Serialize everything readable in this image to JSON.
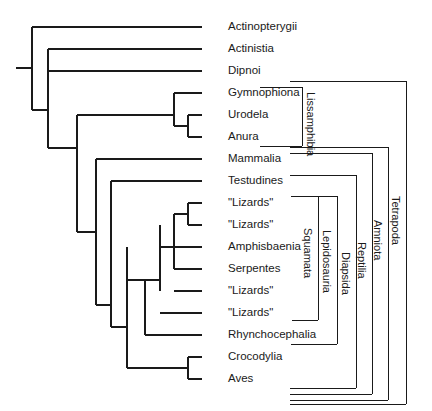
{
  "figure": {
    "type": "cladogram",
    "width": 432,
    "height": 411,
    "line_color": "#1a1a1a",
    "background_color": "#ffffff",
    "text_color": "#1a1a1a"
  },
  "tips": [
    {
      "id": "actinopterygii",
      "label": "Actinopterygii",
      "y": 27,
      "branch_x": 202,
      "label_x": 228
    },
    {
      "id": "actinistia",
      "label": "Actinistia",
      "y": 49,
      "branch_x": 202,
      "label_x": 228
    },
    {
      "id": "dipnoi",
      "label": "Dipnoi",
      "y": 71,
      "branch_x": 202,
      "label_x": 228
    },
    {
      "id": "gymnophiona",
      "label": "Gymnophiona",
      "y": 93,
      "branch_x": 202,
      "label_x": 228
    },
    {
      "id": "urodela",
      "label": "Urodela",
      "y": 115,
      "branch_x": 202,
      "label_x": 228
    },
    {
      "id": "anura",
      "label": "Anura",
      "y": 137,
      "branch_x": 202,
      "label_x": 228
    },
    {
      "id": "mammalia",
      "label": "Mammalia",
      "y": 159,
      "branch_x": 202,
      "label_x": 228
    },
    {
      "id": "testudines",
      "label": "Testudines",
      "y": 181,
      "branch_x": 202,
      "label_x": 228
    },
    {
      "id": "lizards-1",
      "label": "\"Lizards\"",
      "y": 203,
      "branch_x": 202,
      "label_x": 228
    },
    {
      "id": "lizards-2",
      "label": "\"Lizards\"",
      "y": 225,
      "branch_x": 202,
      "label_x": 228
    },
    {
      "id": "amphisbaenia",
      "label": "Amphisbaenia",
      "y": 247,
      "branch_x": 202,
      "label_x": 228
    },
    {
      "id": "serpentes",
      "label": "Serpentes",
      "y": 269,
      "branch_x": 202,
      "label_x": 228
    },
    {
      "id": "lizards-3",
      "label": "\"Lizards\"",
      "y": 291,
      "branch_x": 202,
      "label_x": 228
    },
    {
      "id": "lizards-4",
      "label": "\"Lizards\"",
      "y": 313,
      "branch_x": 202,
      "label_x": 228
    },
    {
      "id": "rhynchocephalia",
      "label": "Rhynchocephalia",
      "y": 335,
      "branch_x": 202,
      "label_x": 228
    },
    {
      "id": "crocodylia",
      "label": "Crocodylia",
      "y": 357,
      "branch_x": 202,
      "label_x": 228
    },
    {
      "id": "aves",
      "label": "Aves",
      "y": 379,
      "branch_x": 202,
      "label_x": 228
    }
  ],
  "nodes": [
    {
      "id": "root",
      "x": 32,
      "top": 27,
      "bottom": 110
    },
    {
      "id": "sarcopterygii",
      "x": 48,
      "top": 49,
      "bottom": 148
    },
    {
      "id": "dipnotetrapod",
      "x": 48,
      "top": 71,
      "bottom": 148
    },
    {
      "id": "tetrapoda",
      "x": 77,
      "top": 115,
      "bottom": 232
    },
    {
      "id": "lissamphibia",
      "x": 174,
      "top": 93,
      "bottom": 126
    },
    {
      "id": "batrachia",
      "x": 188,
      "top": 115,
      "bottom": 137
    },
    {
      "id": "amniota",
      "x": 96,
      "top": 159,
      "bottom": 305
    },
    {
      "id": "reptilia",
      "x": 111,
      "top": 181,
      "bottom": 327
    },
    {
      "id": "archosaur_lep",
      "x": 127,
      "top": 247,
      "bottom": 368
    },
    {
      "id": "lepidosauria",
      "x": 145,
      "top": 280,
      "bottom": 335
    },
    {
      "id": "squamata",
      "x": 160,
      "top": 225,
      "bottom": 291
    },
    {
      "id": "squam_inner",
      "x": 174,
      "top": 214,
      "bottom": 269
    },
    {
      "id": "lizard_pair",
      "x": 188,
      "top": 203,
      "bottom": 225
    },
    {
      "id": "archosauria",
      "x": 188,
      "top": 357,
      "bottom": 379
    }
  ],
  "root_stub": {
    "x_start": 16,
    "x_end": 32,
    "y": 68
  },
  "clades": [
    {
      "id": "lissamphibia-bracket",
      "label": "Lissamphibia",
      "bracket_x": 302,
      "top_y": 87,
      "bottom_y": 146,
      "tick_len": 42,
      "label_x": 316,
      "label_y": 92
    },
    {
      "id": "squamata-bracket",
      "label": "Squamata",
      "bracket_x": 318,
      "top_y": 196,
      "bottom_y": 320,
      "tick_len": 26,
      "label_x": 313,
      "label_y": 228
    },
    {
      "id": "lepidosauria-bracket",
      "label": "Lepidosauria",
      "bracket_x": 337,
      "top_y": 196,
      "bottom_y": 344,
      "tick_len": 46,
      "label_x": 332,
      "label_y": 230
    },
    {
      "id": "diapsida-bracket",
      "label": "Diapsida",
      "bracket_x": 356,
      "top_y": 175,
      "bottom_y": 388,
      "tick_len": 66,
      "label_x": 351,
      "label_y": 252
    },
    {
      "id": "reptilia-bracket",
      "label": "Reptilia",
      "bracket_x": 372,
      "top_y": 153,
      "bottom_y": 394,
      "tick_len": 82,
      "label_x": 367,
      "label_y": 242
    },
    {
      "id": "amniota-bracket",
      "label": "Amniota",
      "bracket_x": 388,
      "top_y": 147,
      "bottom_y": 400,
      "tick_len": 98,
      "label_x": 383,
      "label_y": 220
    },
    {
      "id": "tetrapoda-bracket",
      "label": "Tetrapoda",
      "bracket_x": 406,
      "top_y": 81,
      "bottom_y": 404,
      "tick_len": 116,
      "label_x": 401,
      "label_y": 196
    }
  ]
}
